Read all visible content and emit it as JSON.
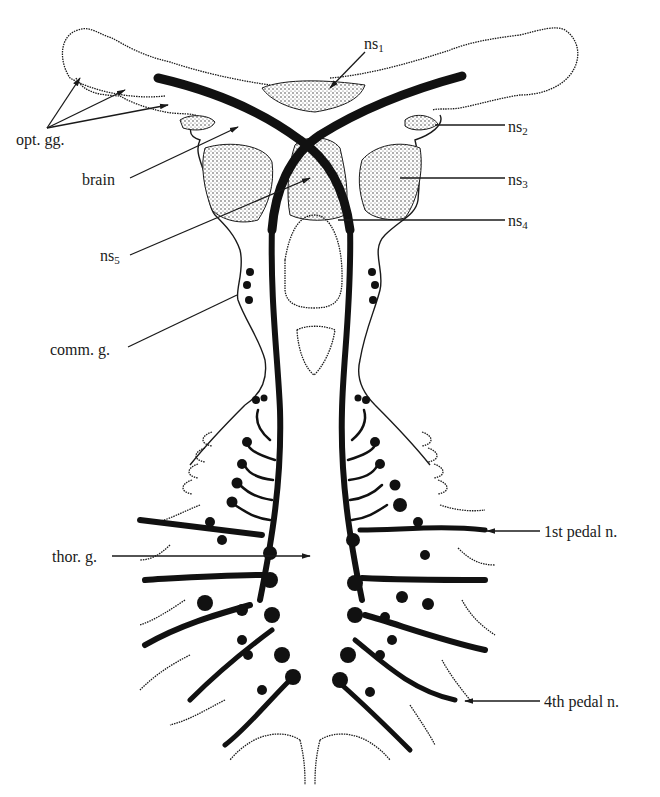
{
  "figure": {
    "colors": {
      "ink": "#111111",
      "background": "#ffffff"
    }
  },
  "labels": {
    "opt_gg": {
      "text": "opt. gg."
    },
    "brain": {
      "text": "brain"
    },
    "ns1": {
      "base": "ns",
      "sub": "1"
    },
    "ns2": {
      "base": "ns",
      "sub": "2"
    },
    "ns3": {
      "base": "ns",
      "sub": "3"
    },
    "ns4": {
      "base": "ns",
      "sub": "4"
    },
    "ns5": {
      "base": "ns",
      "sub": "5"
    },
    "comm_g": {
      "text": "comm. g."
    },
    "thor_g": {
      "text": "thor. g."
    },
    "pedal_1": {
      "text": "1st pedal n."
    },
    "pedal_4": {
      "text": "4th pedal n."
    }
  }
}
